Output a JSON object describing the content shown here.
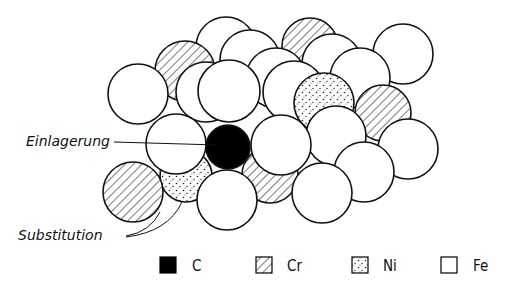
{
  "diagram": {
    "title": "",
    "labels": {
      "interstitial": "Einlagerung",
      "substitution": "Substitution"
    },
    "legend": [
      {
        "key": "C",
        "label": "C",
        "fill": "solid",
        "color": "#000000"
      },
      {
        "key": "Cr",
        "label": "Cr",
        "fill": "hatched",
        "color": "#000000"
      },
      {
        "key": "Ni",
        "label": "Ni",
        "fill": "dotted",
        "color": "#000000"
      },
      {
        "key": "Fe",
        "label": "Fe",
        "fill": "empty",
        "color": "#ffffff"
      }
    ],
    "atoms": [
      {
        "el": "Fe",
        "cx": 226,
        "cy": 47,
        "r": 30
      },
      {
        "el": "Cr",
        "cx": 185,
        "cy": 71,
        "r": 30
      },
      {
        "el": "Fe",
        "cx": 250,
        "cy": 60,
        "r": 30
      },
      {
        "el": "Cr",
        "cx": 310,
        "cy": 46,
        "r": 28
      },
      {
        "el": "Fe",
        "cx": 332,
        "cy": 64,
        "r": 30
      },
      {
        "el": "Fe",
        "cx": 403,
        "cy": 54,
        "r": 30
      },
      {
        "el": "Fe",
        "cx": 276,
        "cy": 78,
        "r": 30
      },
      {
        "el": "Fe",
        "cx": 360,
        "cy": 78,
        "r": 30
      },
      {
        "el": "Cr",
        "cx": 383,
        "cy": 113,
        "r": 28
      },
      {
        "el": "Fe",
        "cx": 138,
        "cy": 94,
        "r": 30
      },
      {
        "el": "Fe",
        "cx": 206,
        "cy": 92,
        "r": 30
      },
      {
        "el": "Fe",
        "cx": 229,
        "cy": 91,
        "r": 31
      },
      {
        "el": "Fe",
        "cx": 294,
        "cy": 92,
        "r": 31
      },
      {
        "el": "Ni",
        "cx": 324,
        "cy": 103,
        "r": 30
      },
      {
        "el": "Fe",
        "cx": 408,
        "cy": 149,
        "r": 30
      },
      {
        "el": "Fe",
        "cx": 336,
        "cy": 136,
        "r": 30
      },
      {
        "el": "Fe",
        "cx": 364,
        "cy": 172,
        "r": 30
      },
      {
        "el": "Ni",
        "cx": 186,
        "cy": 176,
        "r": 26
      },
      {
        "el": "Cr",
        "cx": 270,
        "cy": 175,
        "r": 28
      },
      {
        "el": "Fe",
        "cx": 176,
        "cy": 144,
        "r": 30
      },
      {
        "el": "C",
        "cx": 228,
        "cy": 147,
        "r": 22
      },
      {
        "el": "Fe",
        "cx": 281,
        "cy": 145,
        "r": 30
      },
      {
        "el": "Cr",
        "cx": 133,
        "cy": 192,
        "r": 30
      },
      {
        "el": "Fe",
        "cx": 227,
        "cy": 200,
        "r": 30
      },
      {
        "el": "Fe",
        "cx": 322,
        "cy": 193,
        "r": 30
      }
    ]
  }
}
